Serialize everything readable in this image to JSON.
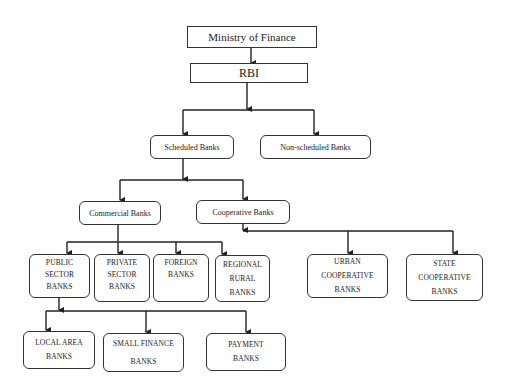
{
  "diagram": {
    "type": "hierarchy",
    "nodes": {
      "ministry": {
        "label": "Ministry of Finance"
      },
      "rbi": {
        "label": "RBI"
      },
      "scheduled": {
        "label": "Scheduled Banks"
      },
      "non_scheduled": {
        "label": "Non-scheduled Banks"
      },
      "commercial": {
        "label": "Commercial Banks"
      },
      "cooperative": {
        "label": "Cooperative Banks"
      },
      "public_sector": {
        "lines": [
          "PUBLIC",
          "SECTOR",
          "BANKS"
        ]
      },
      "private_sector": {
        "lines": [
          "PRIVATE",
          "SECTOR",
          "BANKS"
        ]
      },
      "foreign": {
        "lines": [
          "FOREIGN",
          "BANKS"
        ]
      },
      "regional_rural": {
        "lines": [
          "REGIONAL",
          "RURAL",
          "BANKS"
        ]
      },
      "urban_cooperative": {
        "lines": [
          "URBAN",
          "COOPERATIVE",
          "BANKS"
        ]
      },
      "state_cooperative": {
        "lines": [
          "STATE",
          "COOPERATIVE",
          "BANKS"
        ]
      },
      "local_area": {
        "lines": [
          "LOCAL AREA",
          "BANKS"
        ]
      },
      "small_finance": {
        "lines": [
          "SMALL FINANCE",
          "BANKS"
        ]
      },
      "payment": {
        "lines": [
          "PAYMENT",
          "BANKS"
        ]
      }
    },
    "edges": [
      [
        "ministry",
        "rbi"
      ],
      [
        "rbi",
        "scheduled"
      ],
      [
        "rbi",
        "non_scheduled"
      ],
      [
        "scheduled",
        "commercial"
      ],
      [
        "scheduled",
        "cooperative"
      ],
      [
        "commercial",
        "public_sector"
      ],
      [
        "commercial",
        "private_sector"
      ],
      [
        "commercial",
        "foreign"
      ],
      [
        "commercial",
        "regional_rural"
      ],
      [
        "cooperative",
        "urban_cooperative"
      ],
      [
        "cooperative",
        "state_cooperative"
      ],
      [
        "public_sector",
        "local_area"
      ],
      [
        "public_sector",
        "small_finance"
      ],
      [
        "public_sector",
        "payment"
      ]
    ]
  }
}
